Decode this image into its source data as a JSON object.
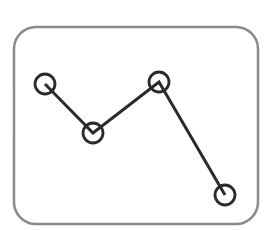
{
  "icon": {
    "name": "line-chart-icon",
    "frame_color": "#8a8a8a",
    "stroke_color": "#2a2a2a",
    "points": [
      [
        45,
        84
      ],
      [
        93,
        133
      ],
      [
        159,
        82
      ],
      [
        225,
        195
      ]
    ]
  }
}
